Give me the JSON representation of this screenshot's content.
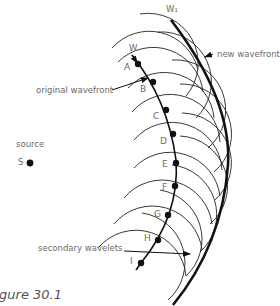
{
  "figure": {
    "caption": "Figure 30.1",
    "labels": {
      "source": "source",
      "source_point": "S",
      "original_wavefront": "original wavefront",
      "new_wavefront": "new wavefront",
      "secondary_wavelets": "secondary wavelets",
      "W": "W",
      "W1": "W₁"
    },
    "points": [
      {
        "label": "A",
        "x": 138,
        "y": 64
      },
      {
        "label": "B",
        "x": 153,
        "y": 82
      },
      {
        "label": "C",
        "x": 166,
        "y": 110
      },
      {
        "label": "D",
        "x": 173,
        "y": 134
      },
      {
        "label": "E",
        "x": 176,
        "y": 163
      },
      {
        "label": "F",
        "x": 175,
        "y": 186
      },
      {
        "label": "G",
        "x": 168,
        "y": 215
      },
      {
        "label": "H",
        "x": 158,
        "y": 240
      },
      {
        "label": "I",
        "x": 141,
        "y": 263
      }
    ],
    "colors": {
      "ink": "#111111",
      "label": "#6b6b6b"
    }
  }
}
